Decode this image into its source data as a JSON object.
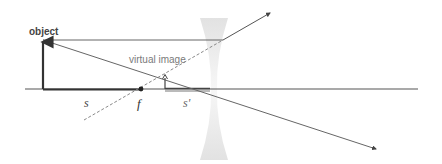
{
  "diagram": {
    "type": "optics-ray-diagram",
    "labels": {
      "object": "object",
      "virtual_image": "virtual image",
      "object_distance": "s",
      "focal_point": "f",
      "image_distance": "s'"
    },
    "colors": {
      "background": "#ffffff",
      "axis": "#555555",
      "object_arrow": "#333333",
      "ray": "#666666",
      "dashed_ray": "#8a8a8a",
      "lens": "#e6e6e6",
      "label_sans": "#444444",
      "label_serif": "#333333"
    },
    "elements": {
      "optical_axis": {
        "x1": 25,
        "y": 89,
        "x2": 418
      },
      "object_arrow": {
        "x": 43,
        "base_y": 89,
        "tip_y": 40
      },
      "lens": {
        "center_x": 214,
        "top_y": 18,
        "bottom_y": 160,
        "waist_y": 89
      },
      "focal_point": {
        "x": 141,
        "y": 89
      },
      "virtual_image_arrow": {
        "x": 165,
        "base_y": 89,
        "tip_y": 75
      },
      "image_distance_bar": {
        "x1": 165,
        "x2": 210,
        "y": 90
      }
    }
  }
}
